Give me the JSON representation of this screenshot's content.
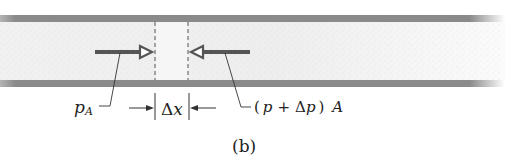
{
  "figure": {
    "panel_label": "(b)",
    "labels": {
      "left_force": "p",
      "left_force_subscript": "A",
      "right_force_open": "(",
      "right_force_p": "p",
      "right_force_plus": "+",
      "right_force_delta": "Δ",
      "right_force_p2": "p",
      "right_force_close": ")",
      "right_force_area": "A",
      "element_length_delta": "Δ",
      "element_length_var": "x"
    },
    "colors": {
      "pipe_wall": "#8a8a8a",
      "arrow": "#555555",
      "line": "#333333",
      "fluid_texture": "#cfcfcf"
    }
  }
}
